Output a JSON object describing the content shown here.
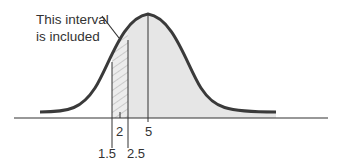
{
  "diagram": {
    "type": "normal-distribution-continuity-correction",
    "annotation": {
      "line1": "This interval",
      "line2": "is included"
    },
    "axis_labels": {
      "lower_bound": "1.5",
      "value": "2",
      "upper_bound": "2.5",
      "mean": "5"
    },
    "colors": {
      "curve": "#3a3a3a",
      "shaded_area": "#e6e6e6",
      "hatch": "#b0b0b0",
      "axis": "#333333"
    }
  }
}
